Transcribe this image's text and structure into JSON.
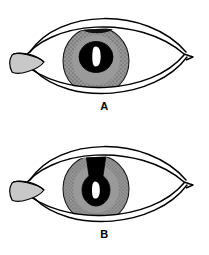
{
  "figure": {
    "background_color": "#ffffff",
    "width": 209,
    "height": 255
  },
  "palette": {
    "outline": "#000000",
    "iris_fill": "#969696",
    "iris_stipple": "#3a3a3a",
    "pupil_fill": "#000000",
    "highlight": "#ffffff",
    "caruncle_fill": "#c8c8c8",
    "sclera_fill": "#ffffff",
    "label_color": "#000000"
  },
  "panels": [
    {
      "id": "panel-a",
      "label": "A",
      "caption": "A",
      "description": "Eye with normal round central pupil and a small dark defect at the superior iris margin",
      "iris": {
        "shape": "circle",
        "center_x": 96,
        "center_y": 61,
        "radius_x": 33,
        "radius_y": 34,
        "texture": "stippled-dots"
      },
      "pupil": {
        "shape": "round",
        "center_x": 96,
        "center_y": 57,
        "radius_x": 17,
        "radius_y": 15,
        "highlight": "vertical-catchlight"
      },
      "defect": {
        "present": true,
        "location": "superior-iris",
        "shape": "small-dark-notch"
      }
    },
    {
      "id": "panel-b",
      "label": "B",
      "caption": "B",
      "description": "Eye with teardrop-shaped peaked pupil drawn upward toward a superior limbal wound, indicating iris prolapse",
      "iris": {
        "shape": "circle",
        "center_x": 96,
        "center_y": 61,
        "radius_x": 33,
        "radius_y": 34,
        "texture": "radial-dotted-crypts"
      },
      "pupil": {
        "shape": "teardrop-peaked",
        "center_x": 96,
        "center_y": 63,
        "radius_x": 16,
        "radius_y": 15,
        "peak_apex_y": 27,
        "peak_width_top": 20,
        "highlight": "vertical-catchlight"
      },
      "defect": {
        "present": true,
        "location": "superior-limbus",
        "shape": "wedge-prolapse"
      }
    }
  ],
  "anatomy": {
    "upper_lid_label": "upper eyelid",
    "lower_lid_label": "lower eyelid",
    "medial_canthus_label": "medial canthus",
    "lateral_canthus_label": "lateral canthus",
    "caruncle_label": "caruncle"
  }
}
